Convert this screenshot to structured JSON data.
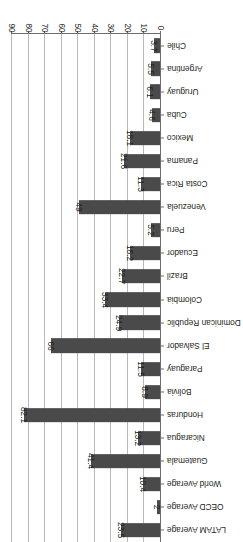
{
  "chart_data": {
    "type": "bar",
    "orientation": "horizontal",
    "title": "",
    "subtitle": "",
    "xlabel": "",
    "ylabel": "",
    "xlim": [
      0,
      90
    ],
    "xticks": [
      0,
      10,
      20,
      30,
      40,
      50,
      60,
      70,
      80,
      90
    ],
    "tick_labels": [
      "0",
      "10",
      "20",
      "30",
      "40",
      "50",
      "60",
      "70",
      "80",
      "90"
    ],
    "grid": true,
    "legend": null,
    "legend_position": "none",
    "bar_color": "#4a4a4a",
    "gridline_color": "#b9b9b9",
    "axis_color": "#6d6d6d",
    "text_color": "#231f20",
    "categories": [
      "Chile",
      "Argentina",
      "Uruguay",
      "Cuba",
      "Mexico",
      "Panama",
      "Costa Rica",
      "Venezuela",
      "Peru",
      "Ecuador",
      "Brazil",
      "Colombia",
      "Dominican Republic",
      "El Salvador",
      "Paraguay",
      "Bolivia",
      "Honduras",
      "Nicaragua",
      "Guatemala",
      "World Average",
      "OECD Average",
      "LATAM Average"
    ],
    "values": [
      3.7,
      5.5,
      6.1,
      4.6,
      18.1,
      21.6,
      11.3,
      49,
      5.2,
      18.2,
      22.7,
      33.4,
      24.9,
      66,
      11.5,
      8.9,
      82.1,
      13.2,
      41.4,
      10.4,
      2,
      23.5
    ],
    "value_labels": [
      "3.7",
      "5.5",
      "6.1",
      "4.6",
      "18.1",
      "21.6",
      "11.3",
      "49",
      "5.2",
      "18.2",
      "22.7",
      "33.4",
      "24.9",
      "66",
      "11.5",
      "8.9",
      "82.1",
      "13.2",
      "41.4",
      "10.4",
      "2",
      "23.5"
    ]
  }
}
